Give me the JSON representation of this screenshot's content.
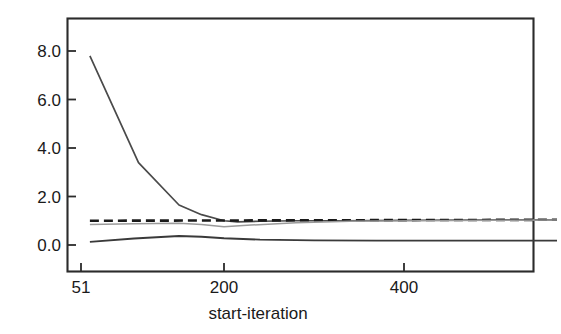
{
  "chart_data": {
    "type": "line",
    "title": "",
    "subtitle": "",
    "xlabel": "start-iteration",
    "ylabel": "",
    "xlim": [
      51,
      570
    ],
    "ylim": [
      -1.1,
      9.0
    ],
    "xticks": [
      51,
      200,
      400
    ],
    "xtick_labels": [
      "51",
      "200",
      "400"
    ],
    "yticks": [
      0.0,
      2.0,
      4.0,
      6.0,
      8.0
    ],
    "ytick_labels": [
      "0.0",
      "2.0",
      "4.0",
      "6.0",
      "8.0"
    ],
    "grid": false,
    "legend": false,
    "legend_position": "none",
    "annotations": [],
    "series": [
      {
        "name": "decaying-diagnostic",
        "style": "solid",
        "color": "#4a4a4a",
        "width": 1.7,
        "x": [
          51,
          105,
          150,
          175,
          200,
          215,
          240,
          280,
          330,
          400,
          470,
          540,
          570
        ],
        "values": [
          7.8,
          3.4,
          1.65,
          1.25,
          1.0,
          0.95,
          0.98,
          1.0,
          1.0,
          1.02,
          1.03,
          1.04,
          1.04
        ]
      },
      {
        "name": "reference-level",
        "style": "dashed",
        "color": "#1a1a1a",
        "width": 2.6,
        "x": [
          51,
          570
        ],
        "values": [
          1.0,
          1.04
        ]
      },
      {
        "name": "rising-diagnostic",
        "style": "solid",
        "color": "#9a9a9a",
        "width": 1.5,
        "x": [
          51,
          100,
          150,
          175,
          200,
          230,
          280,
          340,
          420,
          500,
          570
        ],
        "values": [
          0.85,
          0.88,
          0.9,
          0.85,
          0.75,
          0.82,
          0.92,
          0.98,
          1.0,
          1.02,
          1.03
        ]
      },
      {
        "name": "low-diagnostic",
        "style": "solid",
        "color": "#3a3a3a",
        "width": 1.9,
        "x": [
          51,
          100,
          150,
          175,
          200,
          240,
          300,
          370,
          450,
          520,
          570
        ],
        "values": [
          0.13,
          0.27,
          0.37,
          0.34,
          0.28,
          0.22,
          0.19,
          0.18,
          0.18,
          0.18,
          0.18
        ]
      }
    ]
  },
  "axis": {
    "x_title": "start-iteration",
    "x_tick_0": "51",
    "x_tick_1": "200",
    "x_tick_2": "400",
    "y_tick_0": "0.0",
    "y_tick_1": "2.0",
    "y_tick_2": "4.0",
    "y_tick_3": "6.0",
    "y_tick_4": "8.0"
  },
  "colors": {
    "frame": "#2b2b2b",
    "text": "#1a1a1a",
    "series_dark": "#4a4a4a",
    "series_dashed": "#1a1a1a",
    "series_light": "#9a9a9a",
    "series_low": "#3a3a3a",
    "background": "#ffffff"
  }
}
